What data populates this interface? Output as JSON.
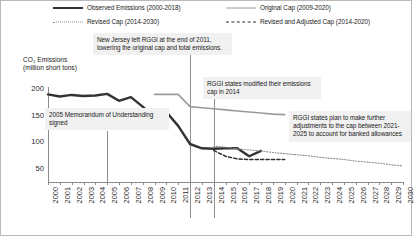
{
  "legend": {
    "items": [
      {
        "label": "Observed Emissions (2000-2018)",
        "style": "solid-dark",
        "color": "#333333"
      },
      {
        "label": "Original Cap (2009-2020)",
        "style": "solid-gray",
        "color": "#9a9a9a"
      },
      {
        "label": "Revised Cap (2014-2030)",
        "style": "dotted-gray",
        "color": "#8f8f8f"
      },
      {
        "label": "Revised and Adjusted Cap (2014-2020)",
        "style": "dashed-dark",
        "color": "#2e2e2e"
      }
    ]
  },
  "annotations": [
    {
      "id": "nj-exit",
      "text": "New Jersey left RGGI at the end of 2011, lowering the original cap and total emissions."
    },
    {
      "id": "memorandum",
      "text": "2005 Memorandum of Understanding signed"
    },
    {
      "id": "cap-modified",
      "text": "RGGI states modified their emissions cap in 2014"
    },
    {
      "id": "future-adjustments",
      "text": "RGGI states plan to make further adjustments to the cap between 2021-2025 to account for banked allowances"
    }
  ],
  "chart_data": {
    "type": "line",
    "title": "",
    "xlabel": "",
    "ylabel": "CO₂ Emissions\n(million short tons)",
    "ylim": [
      0,
      215
    ],
    "yticks": [
      50,
      100,
      150,
      200
    ],
    "xlim": [
      2000,
      2030
    ],
    "grid": false,
    "legend_position": "top",
    "x": [
      2000,
      2001,
      2002,
      2003,
      2004,
      2005,
      2006,
      2007,
      2008,
      2009,
      2010,
      2011,
      2012,
      2013,
      2014,
      2015,
      2016,
      2017,
      2018,
      2019,
      2020,
      2021,
      2022,
      2023,
      2024,
      2025,
      2026,
      2027,
      2028,
      2029,
      2030
    ],
    "series": [
      {
        "name": "Observed Emissions (2000-2018)",
        "style": "solid-dark",
        "color": "#333333",
        "x": [
          2000,
          2001,
          2002,
          2003,
          2004,
          2005,
          2006,
          2007,
          2008,
          2009,
          2010,
          2011,
          2012,
          2013,
          2014,
          2015,
          2016,
          2017,
          2018
        ],
        "values": [
          188,
          184,
          187,
          185,
          186,
          189,
          176,
          183,
          165,
          145,
          155,
          129,
          95,
          87,
          86,
          87,
          87,
          72,
          82
        ]
      },
      {
        "name": "Original Cap (2009-2020)",
        "style": "solid-gray",
        "color": "#9a9a9a",
        "x": [
          2009,
          2010,
          2011,
          2012,
          2013,
          2014,
          2015,
          2016,
          2017,
          2018,
          2019,
          2020
        ],
        "values": [
          188,
          188,
          188,
          165,
          163,
          161,
          159,
          157,
          155,
          153,
          151,
          150
        ]
      },
      {
        "name": "Revised Cap (2014-2030)",
        "style": "dotted-gray",
        "color": "#8f8f8f",
        "x": [
          2014,
          2015,
          2016,
          2017,
          2018,
          2019,
          2020,
          2021,
          2022,
          2023,
          2024,
          2025,
          2026,
          2027,
          2028,
          2029,
          2030
        ],
        "values": [
          91,
          89,
          86,
          84,
          82,
          79,
          77,
          75,
          73,
          70,
          68,
          66,
          63,
          61,
          59,
          56,
          54
        ]
      },
      {
        "name": "Revised and Adjusted Cap (2014-2020)",
        "style": "dashed-dark",
        "color": "#2e2e2e",
        "x": [
          2014,
          2015,
          2016,
          2017,
          2018,
          2019,
          2020
        ],
        "values": [
          83,
          72,
          67,
          66,
          66,
          66,
          66
        ]
      }
    ],
    "reference_lines": [
      {
        "label": "2005",
        "x": 2005
      },
      {
        "label": "2012",
        "x": 2012
      },
      {
        "label": "2014",
        "x": 2014
      }
    ]
  }
}
